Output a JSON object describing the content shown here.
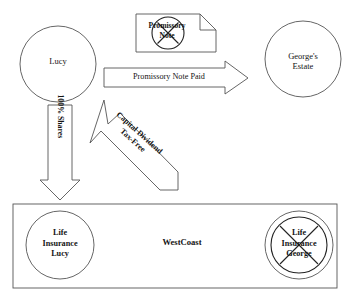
{
  "diagram": {
    "colors": {
      "stroke_light": "#555555",
      "stroke_dark": "#222222",
      "text": "#141414",
      "background": "#ffffff"
    },
    "nodes": {
      "lucy": {
        "label": "Lucy",
        "shape": "circle"
      },
      "georges_estate": {
        "label": "George's\nEstate",
        "shape": "circle"
      },
      "promissory_note_doc": {
        "label": "Promissory\nNote",
        "shape": "document-cancelled"
      },
      "westcoast": {
        "label": "WestCoast",
        "shape": "rectangle"
      },
      "life_insurance_lucy": {
        "label": "Life\nInsurance\nLucy",
        "shape": "circle"
      },
      "life_insurance_george": {
        "label": "Life\nInsurance\nGeorge",
        "shape": "double-circle-cancelled"
      }
    },
    "arrows": {
      "promissory_note_paid": {
        "label": "Promissory Note Paid",
        "direction": "right",
        "from": "lucy",
        "to": "georges_estate"
      },
      "shares": {
        "label": "100% Shares",
        "direction": "down",
        "from": "lucy",
        "to": "westcoast"
      },
      "capital_dividend": {
        "label": "Capital Dividend\nTax-Free",
        "direction": "up-left",
        "from": "westcoast",
        "to": "lucy"
      }
    }
  }
}
